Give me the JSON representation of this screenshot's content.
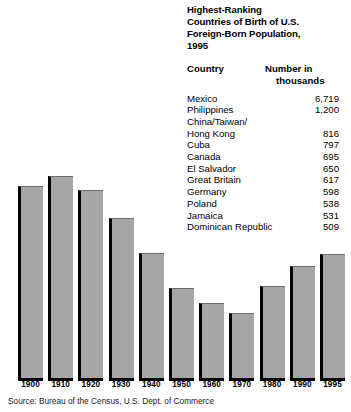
{
  "table": {
    "title": "Highest-Ranking\nCountries of Birth of U.S.\nForeign-Born Population,\n1995",
    "headers": {
      "country": "Country",
      "number_line1": "Number in",
      "number_line2": "thousands"
    },
    "rows": [
      {
        "country": "Mexico",
        "value": "6,719"
      },
      {
        "country": "Philippines",
        "value": "1,200"
      },
      {
        "country": "China/Taiwan/",
        "value": ""
      },
      {
        "country": "Hong Kong",
        "value": "816"
      },
      {
        "country": "Cuba",
        "value": "797"
      },
      {
        "country": "Canada",
        "value": "695"
      },
      {
        "country": "El Salvador",
        "value": "650"
      },
      {
        "country": "Great Britain",
        "value": "617"
      },
      {
        "country": "Germany",
        "value": "598"
      },
      {
        "country": "Poland",
        "value": "538"
      },
      {
        "country": "Jamaica",
        "value": "531"
      },
      {
        "country": "Dominican Republic",
        "value": "509"
      }
    ]
  },
  "source": "Source: Bureau of the Census, U.S. Dept. of Commerce",
  "colors": {
    "bar_fill": "#a6a6a6",
    "bar_shadow": "#000000",
    "text": "#000000"
  },
  "chart_data": {
    "type": "bar",
    "title": "",
    "xlabel": "",
    "ylabel": "",
    "grid": false,
    "legend": "none",
    "ylim": [
      0,
      16
    ],
    "categories": [
      "1900",
      "1910",
      "1920",
      "1930",
      "1940",
      "1950",
      "1960",
      "1970",
      "1980",
      "1990",
      "1995"
    ],
    "values": [
      13.6,
      14.7,
      13.2,
      11.6,
      8.8,
      6.9,
      5.4,
      4.7,
      6.2,
      7.9,
      8.8
    ],
    "bar_pixel_tops": [
      186,
      176,
      190,
      218,
      253,
      288,
      303,
      313,
      286,
      266,
      254
    ],
    "baseline_pixel": 378
  }
}
